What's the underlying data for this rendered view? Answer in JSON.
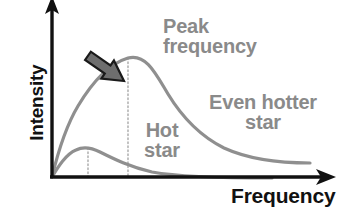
{
  "figure": {
    "type": "diagram",
    "axes": {
      "x_label": "Frequency",
      "y_label": "Intensity",
      "x_axis_color": "#111111",
      "y_axis_color": "#111111",
      "origin": {
        "x": 52,
        "y": 177
      },
      "x_axis_end": {
        "x": 334,
        "y": 177
      },
      "y_axis_top": {
        "x": 52,
        "y": 2
      },
      "arrowheads": [
        "x-axis-right",
        "y-axis-up"
      ]
    },
    "annotations": {
      "peak_frequency": {
        "line1": "Peak",
        "line2": "frequency",
        "color": "#8a8a8a"
      },
      "hot_star": {
        "line1": "Hot",
        "line2": "star",
        "color": "#8a8a8a"
      },
      "even_hotter_star": {
        "line1": "Even hotter",
        "line2": "star",
        "color": "#8a8a8a"
      }
    },
    "pointer_arrow": {
      "name": "peak-frequency-arrow",
      "tip": {
        "x": 124,
        "y": 81
      },
      "tail": {
        "x": 170,
        "y": 48
      },
      "fill": "#6e6e6e",
      "stroke": "#1a1a1a"
    },
    "curves": [
      {
        "name": "hot-star-curve",
        "label": "Hot star",
        "color": "#8f8f8f",
        "peak": {
          "x": 88,
          "y": 148
        },
        "peak_marker_dotted_line": true,
        "points": [
          [
            52,
            177
          ],
          [
            58,
            168
          ],
          [
            64,
            160
          ],
          [
            70,
            154
          ],
          [
            76,
            150
          ],
          [
            82,
            148
          ],
          [
            88,
            147
          ],
          [
            94,
            148
          ],
          [
            102,
            151
          ],
          [
            112,
            156
          ],
          [
            124,
            162
          ],
          [
            138,
            167
          ],
          [
            154,
            171
          ],
          [
            172,
            174
          ],
          [
            192,
            176
          ],
          [
            214,
            177
          ],
          [
            240,
            177
          ],
          [
            270,
            177
          ]
        ]
      },
      {
        "name": "even-hotter-star-curve",
        "label": "Even hotter star",
        "color": "#8f8f8f",
        "peak": {
          "x": 128,
          "y": 58
        },
        "peak_marker_dotted_line": true,
        "points": [
          [
            52,
            177
          ],
          [
            58,
            158
          ],
          [
            64,
            140
          ],
          [
            72,
            120
          ],
          [
            80,
            103
          ],
          [
            90,
            88
          ],
          [
            100,
            75
          ],
          [
            110,
            66
          ],
          [
            120,
            60
          ],
          [
            128,
            58
          ],
          [
            136,
            59
          ],
          [
            146,
            64
          ],
          [
            156,
            73
          ],
          [
            166,
            85
          ],
          [
            176,
            98
          ],
          [
            188,
            112
          ],
          [
            200,
            124
          ],
          [
            214,
            135
          ],
          [
            230,
            145
          ],
          [
            248,
            152
          ],
          [
            268,
            158
          ],
          [
            288,
            161
          ],
          [
            310,
            163
          ]
        ]
      }
    ],
    "dotted_guides": [
      {
        "name": "hot-star-peak-guide",
        "x": 88,
        "y_top": 148,
        "y_bottom": 177
      },
      {
        "name": "even-hotter-star-peak-guide",
        "x": 128,
        "y_top": 58,
        "y_bottom": 177
      }
    ],
    "colors": {
      "background": "#ffffff",
      "curve": "#8f8f8f",
      "annotation_text": "#8a8a8a",
      "axis_text": "#111111",
      "arrow_fill": "#6e6e6e",
      "arrow_stroke": "#1a1a1a",
      "guide_dotted": "#a8a8a8"
    }
  }
}
